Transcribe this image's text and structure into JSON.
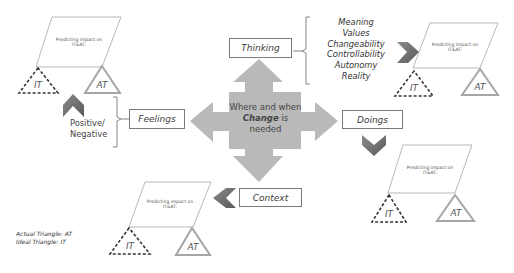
{
  "center": {
    "text_before": "Where and when ",
    "emphasis": "Change",
    "text_after": " is needed"
  },
  "categories": {
    "thinking": "Thinking",
    "feelings": "Feelings",
    "doings": "Doings",
    "context": "Context"
  },
  "thinking_aspects": [
    "Meaning",
    "Values",
    "Changeability",
    "Controllability",
    "Autonomy",
    "Reality"
  ],
  "feelings_aspect": "Positive/ Negative",
  "impact_box_label": "Predicting impact on IT&AT:",
  "triangles": {
    "ideal": "IT",
    "actual": "AT"
  },
  "legend": {
    "actual": "Actual Triangle: AT",
    "ideal": "Ideal Triangle: IT"
  },
  "colors": {
    "arrow_fill": "#b9b9b9",
    "chevron_fill": "#6e6e6e",
    "actual_triangle_stroke": "#a6a6a6",
    "ideal_triangle_stroke": "#333333",
    "box_border": "#7a7a7a"
  }
}
